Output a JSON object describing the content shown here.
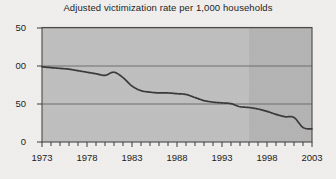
{
  "chart_data": {
    "type": "line",
    "title": "Adjusted victimization rate per 1,000 households",
    "xlabel": "",
    "ylabel": "",
    "xlim": [
      1973,
      2003
    ],
    "ylim": [
      0,
      150
    ],
    "grid": true,
    "legend": "none",
    "y_ticks": [
      {
        "value": 150,
        "label": "50"
      },
      {
        "value": 100,
        "label": "00"
      },
      {
        "value": 50,
        "label": "50"
      },
      {
        "value": 0,
        "label": "0"
      }
    ],
    "y_tick_labels_note": "Leading digits of 150 and 100 are clipped by the left image edge",
    "x_ticks": [
      1973,
      1978,
      1983,
      1988,
      1993,
      1998,
      2003
    ],
    "x_tick_labels": [
      "1973",
      "1978",
      "1983",
      "1988",
      "1993",
      "1998",
      "2003"
    ],
    "x_minor_tick_interval": 1,
    "shaded_band": {
      "label": "",
      "x_start": 1996,
      "x_end": 2003,
      "color": "#b4b4b4"
    },
    "series": [
      {
        "name": "Adjusted victimization rate",
        "color": "#3a3a3a",
        "x": [
          1973,
          1974,
          1975,
          1976,
          1977,
          1978,
          1979,
          1980,
          1981,
          1982,
          1983,
          1984,
          1985,
          1986,
          1987,
          1988,
          1989,
          1990,
          1991,
          1992,
          1993,
          1994,
          1995,
          1996,
          1997,
          1998,
          1999,
          2000,
          2001,
          2002,
          2003
        ],
        "values": [
          98,
          97,
          96,
          95,
          93,
          91,
          89,
          87,
          91,
          84,
          73,
          67,
          65,
          64,
          64,
          63,
          62,
          58,
          54,
          52,
          51,
          50,
          46,
          45,
          43,
          40,
          36,
          33,
          32,
          19,
          17
        ]
      }
    ]
  },
  "colors": {
    "page_background": "#efeeec",
    "plot_background": "#bfbfbf",
    "plot_background_shaded": "#b4b4b4",
    "gridline": "#8a8a8a",
    "axis": "#4a4a4a",
    "line": "#3a3a3a",
    "text": "#1d1d1d"
  }
}
